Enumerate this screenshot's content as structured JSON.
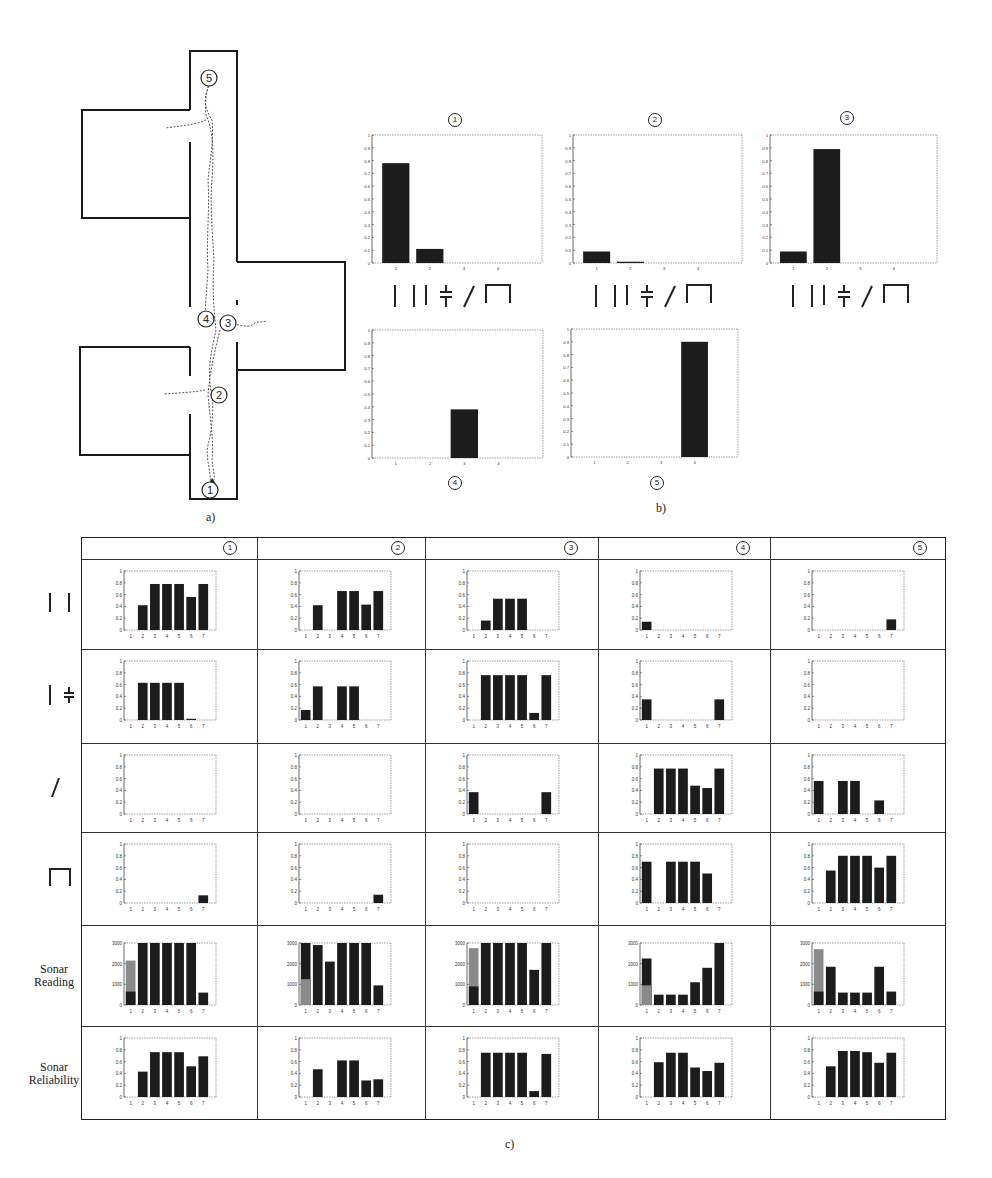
{
  "figure": {
    "panel_a_label": "a)",
    "panel_b_label": "b)",
    "panel_c_label": "c)"
  },
  "floorplan": {
    "markers": [
      {
        "id": "1",
        "label": "1",
        "x": 210,
        "y": 490
      },
      {
        "id": "2",
        "label": "2",
        "x": 219,
        "y": 395
      },
      {
        "id": "3",
        "label": "3",
        "x": 228,
        "y": 323
      },
      {
        "id": "4",
        "label": "4",
        "x": 206,
        "y": 319
      },
      {
        "id": "5",
        "label": "5",
        "x": 209,
        "y": 78
      }
    ],
    "colors": {
      "wall": "#1a1a1a",
      "path": "#555555"
    }
  },
  "landmark_symbols": [
    "single-wall",
    "double-wall",
    "door-gap",
    "diagonal",
    "dead-end"
  ],
  "chart_data": [
    {
      "id": "b1",
      "type": "bar",
      "title": "1",
      "categories": [
        "1",
        "2",
        "3",
        "4"
      ],
      "values": [
        0.78,
        0.11,
        0,
        0
      ],
      "ylim": [
        0,
        1
      ],
      "yticks": [
        0,
        0.1,
        0.2,
        0.3,
        0.4,
        0.5,
        0.6,
        0.7,
        0.8,
        0.9,
        1
      ],
      "xlabel_symbols": [
        "|",
        "||",
        "╪",
        "/",
        "⊓"
      ],
      "grid": false
    },
    {
      "id": "b2",
      "type": "bar",
      "title": "2",
      "categories": [
        "1",
        "2",
        "3",
        "4"
      ],
      "values": [
        0.09,
        0.01,
        0,
        0
      ],
      "ylim": [
        0,
        1
      ],
      "yticks": [
        0,
        0.1,
        0.2,
        0.3,
        0.4,
        0.5,
        0.6,
        0.7,
        0.8,
        0.9,
        1
      ],
      "xlabel_symbols": [
        "|",
        "||",
        "╪",
        "/",
        "⊓"
      ],
      "grid": false
    },
    {
      "id": "b3",
      "type": "bar",
      "title": "3",
      "categories": [
        "1",
        "2",
        "3",
        "4"
      ],
      "values": [
        0.09,
        0.89,
        0,
        0
      ],
      "ylim": [
        0,
        1
      ],
      "yticks": [
        0,
        0.1,
        0.2,
        0.3,
        0.4,
        0.5,
        0.6,
        0.7,
        0.8,
        0.9,
        1
      ],
      "xlabel_symbols": [
        "|",
        "||",
        "╪",
        "/",
        "⊓"
      ],
      "grid": false
    },
    {
      "id": "b4",
      "type": "bar",
      "title": "4",
      "categories": [
        "1",
        "2",
        "3",
        "4"
      ],
      "values": [
        0,
        0,
        0.38,
        0
      ],
      "ylim": [
        0,
        1
      ],
      "yticks": [
        0,
        0.1,
        0.2,
        0.3,
        0.4,
        0.5,
        0.6,
        0.7,
        0.8,
        0.9,
        1
      ],
      "grid": false
    },
    {
      "id": "b5",
      "type": "bar",
      "title": "5",
      "categories": [
        "1",
        "2",
        "3",
        "4"
      ],
      "values": [
        0,
        0,
        0,
        0.9
      ],
      "ylim": [
        0,
        1
      ],
      "yticks": [
        0,
        0.1,
        0.2,
        0.3,
        0.4,
        0.5,
        0.6,
        0.7,
        0.8,
        0.9,
        1
      ],
      "grid": false
    },
    {
      "id": "c_table",
      "type": "table",
      "columns": [
        "1",
        "2",
        "3",
        "4",
        "5"
      ],
      "rows": [
        {
          "label": "| |",
          "symbol": "double-wall",
          "type": "bar",
          "ylim": [
            0,
            1
          ],
          "yticks": [
            0,
            0.2,
            0.4,
            0.6,
            0.8,
            1
          ],
          "categories": [
            "1",
            "2",
            "3",
            "4",
            "5",
            "6",
            "7"
          ],
          "cells": [
            [
              0,
              0.42,
              0.78,
              0.78,
              0.78,
              0.56,
              0.78
            ],
            [
              0,
              0.42,
              0,
              0.66,
              0.66,
              0.43,
              0.66
            ],
            [
              0,
              0.16,
              0.53,
              0.53,
              0.53,
              0,
              0
            ],
            [
              0.14,
              0,
              0,
              0,
              0,
              0,
              0
            ],
            [
              0,
              0,
              0,
              0,
              0,
              0,
              0.18
            ]
          ]
        },
        {
          "label": "| ╪",
          "symbol": "wall-door",
          "type": "bar",
          "ylim": [
            0,
            1
          ],
          "yticks": [
            0,
            0.2,
            0.4,
            0.6,
            0.8,
            1
          ],
          "categories": [
            "1",
            "2",
            "3",
            "4",
            "5",
            "6",
            "7"
          ],
          "cells": [
            [
              0,
              0.63,
              0.63,
              0.63,
              0.63,
              0.02,
              0
            ],
            [
              0.17,
              0.57,
              0,
              0.57,
              0.57,
              0,
              0
            ],
            [
              0,
              0.76,
              0.76,
              0.76,
              0.76,
              0.12,
              0.76
            ],
            [
              0.35,
              0,
              0,
              0,
              0,
              0,
              0.35
            ],
            [
              0,
              0,
              0,
              0,
              0,
              0,
              0
            ]
          ]
        },
        {
          "label": "/",
          "symbol": "diagonal",
          "type": "bar",
          "ylim": [
            0,
            1
          ],
          "yticks": [
            0,
            0.2,
            0.4,
            0.6,
            0.8,
            1
          ],
          "categories": [
            "1",
            "2",
            "3",
            "4",
            "5",
            "6",
            "7"
          ],
          "cells": [
            [
              0,
              0,
              0,
              0,
              0,
              0,
              0
            ],
            [
              0,
              0,
              0,
              0,
              0,
              0,
              0
            ],
            [
              0.37,
              0,
              0,
              0,
              0,
              0,
              0.37
            ],
            [
              0,
              0.77,
              0.77,
              0.77,
              0.48,
              0.44,
              0.77
            ],
            [
              0.56,
              0,
              0.56,
              0.56,
              0,
              0.23,
              0
            ]
          ]
        },
        {
          "label": "⊓",
          "symbol": "dead-end",
          "type": "bar",
          "ylim": [
            0,
            1
          ],
          "yticks": [
            0,
            0.2,
            0.4,
            0.6,
            0.8,
            1
          ],
          "categories": [
            "1",
            "2",
            "3",
            "4",
            "5",
            "6",
            "7"
          ],
          "cells": [
            [
              0,
              0,
              0,
              0,
              0,
              0,
              0.13
            ],
            [
              0,
              0,
              0,
              0,
              0,
              0,
              0.14
            ],
            [
              0,
              0,
              0,
              0,
              0,
              0,
              0
            ],
            [
              0.7,
              0,
              0.7,
              0.7,
              0.7,
              0.5,
              0
            ],
            [
              0,
              0.55,
              0.8,
              0.8,
              0.8,
              0.6,
              0.8
            ]
          ]
        },
        {
          "label": "Sonar Reading",
          "type": "stacked-bar",
          "ylim": [
            0,
            3000
          ],
          "yticks": [
            0,
            1000,
            2000,
            3000
          ],
          "categories": [
            "1",
            "2",
            "3",
            "4",
            "5",
            "6",
            "7"
          ],
          "series_names": [
            "dark",
            "gray"
          ],
          "cells": [
            {
              "dark": [
                650,
                3000,
                3000,
                3000,
                3000,
                3000,
                600
              ],
              "gray_top": [
                2150,
                0,
                0,
                0,
                0,
                0,
                0
              ]
            },
            {
              "dark": [
                3000,
                2900,
                2100,
                3000,
                3000,
                3000,
                950
              ],
              "gray_top": [
                1250,
                0,
                0,
                0,
                0,
                0,
                0
              ]
            },
            {
              "dark": [
                900,
                3000,
                3000,
                3000,
                3000,
                1700,
                3000
              ],
              "gray_top": [
                2750,
                0,
                0,
                0,
                0,
                0,
                0
              ]
            },
            {
              "dark": [
                2250,
                500,
                500,
                500,
                1100,
                1800,
                3000
              ],
              "gray_top": [
                950,
                0,
                0,
                0,
                0,
                0,
                0
              ]
            },
            {
              "dark": [
                650,
                1850,
                600,
                600,
                600,
                1850,
                650
              ],
              "gray_top": [
                2700,
                0,
                0,
                0,
                0,
                0,
                0
              ]
            }
          ]
        },
        {
          "label": "Sonar Reliability",
          "type": "bar",
          "ylim": [
            0,
            1
          ],
          "yticks": [
            0,
            0.2,
            0.4,
            0.6,
            0.8,
            1
          ],
          "categories": [
            "1",
            "2",
            "3",
            "4",
            "5",
            "6",
            "7"
          ],
          "cells": [
            [
              0,
              0.43,
              0.76,
              0.76,
              0.76,
              0.52,
              0.69
            ],
            [
              0,
              0.47,
              0,
              0.62,
              0.62,
              0.28,
              0.3
            ],
            [
              0,
              0.75,
              0.75,
              0.75,
              0.75,
              0.1,
              0.73
            ],
            [
              0,
              0.59,
              0.75,
              0.75,
              0.5,
              0.44,
              0.58
            ],
            [
              0,
              0.52,
              0.78,
              0.78,
              0.76,
              0.58,
              0.75
            ]
          ]
        }
      ]
    }
  ],
  "colors": {
    "bar": "#1c1c1c",
    "bar_gray": "#8a8a8a",
    "axis": "#444444",
    "dotted": "#888888"
  }
}
